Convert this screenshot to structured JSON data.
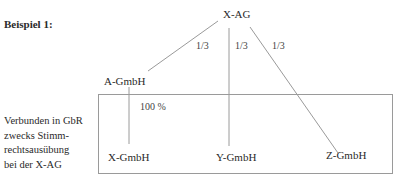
{
  "heading": "Beispiel 1:",
  "nodes": {
    "top": "X-AG",
    "a": "A-GmbH",
    "x": "X-GmbH",
    "y": "Y-GmbH",
    "z": "Z-GmbH"
  },
  "edges": {
    "ag_to_a": "1/3",
    "ag_to_y": "1/3",
    "ag_to_z": "1/3",
    "a_to_x": "100 %"
  },
  "group_label": {
    "lines": [
      "Verbunden in GbR",
      "zwecks Stimm-",
      "rechtsausübung",
      "bei der X-AG"
    ]
  },
  "colors": {
    "line": "#9a9a9a",
    "text": "#2a2a2a"
  }
}
